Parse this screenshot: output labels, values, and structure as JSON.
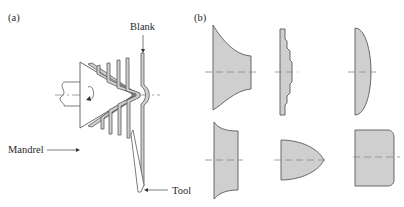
{
  "figure": {
    "panel_a": {
      "label": "(a)",
      "callouts": {
        "blank": "Blank",
        "mandrel": "Mandrel",
        "tool": "Tool"
      },
      "description": "Conventional spinning: a flat blank is progressively formed over a rotating conical mandrel by a tool"
    },
    "panel_b": {
      "label": "(b)",
      "shapes": [
        {
          "row": 1,
          "col": 1,
          "name": "flared-bell"
        },
        {
          "row": 1,
          "col": 2,
          "name": "stepped-disc"
        },
        {
          "row": 1,
          "col": 3,
          "name": "shallow-dome"
        },
        {
          "row": 2,
          "col": 1,
          "name": "concave-flange-cylinder"
        },
        {
          "row": 2,
          "col": 2,
          "name": "parabolic-nose"
        },
        {
          "row": 2,
          "col": 3,
          "name": "round-corner-cup"
        }
      ]
    },
    "colors": {
      "fill": "#cfcfcf",
      "stroke": "#5a5a5a",
      "centerline": "#8a8a8a",
      "text": "#2a2a2a"
    }
  }
}
